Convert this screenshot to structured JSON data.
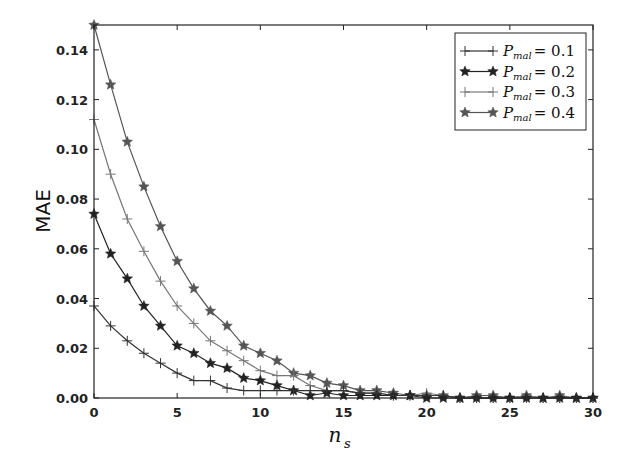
{
  "chart_data": {
    "type": "line",
    "title": "",
    "xlabel": "n_s",
    "ylabel": "MAE",
    "xlim": [
      0,
      30
    ],
    "ylim": [
      0,
      0.15
    ],
    "xticks": [
      0,
      5,
      10,
      15,
      20,
      25,
      30
    ],
    "yticks": [
      0.0,
      0.02,
      0.04,
      0.06,
      0.08,
      0.1,
      0.12,
      0.14
    ],
    "xtick_labels": [
      "0",
      "5",
      "10",
      "15",
      "20",
      "25",
      "30"
    ],
    "ytick_labels": [
      "0.00",
      "0.02",
      "0.04",
      "0.06",
      "0.08",
      "0.10",
      "0.12",
      "0.14"
    ],
    "grid": false,
    "legend_position": "upper right",
    "x": [
      0,
      1,
      2,
      3,
      4,
      5,
      6,
      7,
      8,
      9,
      10,
      11,
      12,
      13,
      14,
      15,
      16,
      17,
      18,
      19,
      20,
      21,
      22,
      23,
      24,
      25,
      26,
      27,
      28,
      29,
      30
    ],
    "series": [
      {
        "name": "P_mal = 0.1",
        "legend_label": "P",
        "legend_sub": "mal",
        "legend_value": "= 0.1",
        "marker": "plus",
        "color": "#333333",
        "values": [
          0.037,
          0.029,
          0.023,
          0.018,
          0.014,
          0.01,
          0.007,
          0.007,
          0.004,
          0.003,
          0.003,
          0.003,
          0.003,
          0.003,
          0.003,
          0.003,
          0.002,
          0.002,
          0.001,
          0.001,
          0.001,
          0.001,
          0.0,
          0.0,
          0.0,
          0.0,
          0.0,
          0.0,
          0.0,
          0.0,
          0.0
        ]
      },
      {
        "name": "P_mal = 0.2",
        "legend_label": "P",
        "legend_sub": "mal",
        "legend_value": "= 0.2",
        "marker": "star",
        "color": "#222222",
        "values": [
          0.074,
          0.058,
          0.048,
          0.037,
          0.029,
          0.021,
          0.018,
          0.014,
          0.012,
          0.008,
          0.007,
          0.005,
          0.003,
          0.001,
          0.002,
          0.001,
          0.001,
          0.001,
          0.001,
          0.001,
          0.0,
          0.0,
          0.0,
          0.0,
          0.0,
          0.0,
          0.0,
          0.0,
          0.0,
          0.0,
          0.0
        ]
      },
      {
        "name": "P_mal = 0.3",
        "legend_label": "P",
        "legend_sub": "mal",
        "legend_value": "= 0.3",
        "marker": "plus",
        "color": "#777777",
        "values": [
          0.112,
          0.09,
          0.072,
          0.059,
          0.047,
          0.037,
          0.03,
          0.023,
          0.019,
          0.015,
          0.011,
          0.009,
          0.009,
          0.005,
          0.003,
          0.003,
          0.002,
          0.002,
          0.001,
          0.001,
          0.002,
          0.001,
          0.0,
          0.0,
          0.0,
          0.0,
          0.001,
          0.0,
          0.0,
          0.0,
          0.0
        ]
      },
      {
        "name": "P_mal = 0.4",
        "legend_label": "P",
        "legend_sub": "mal",
        "legend_value": "= 0.4",
        "marker": "star",
        "color": "#555555",
        "values": [
          0.15,
          0.126,
          0.103,
          0.085,
          0.069,
          0.055,
          0.044,
          0.035,
          0.029,
          0.021,
          0.018,
          0.015,
          0.01,
          0.009,
          0.006,
          0.005,
          0.003,
          0.003,
          0.002,
          0.001,
          0.001,
          0.001,
          0.0,
          0.001,
          0.001,
          0.0,
          0.001,
          0.0,
          0.001,
          0.0,
          0.0
        ]
      }
    ]
  }
}
